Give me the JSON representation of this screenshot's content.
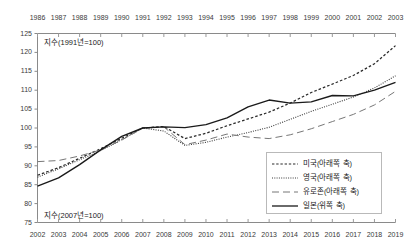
{
  "chart_data": {
    "type": "line",
    "title": "",
    "grid": false,
    "legend_position": "bottom-right",
    "top_axis": {
      "name": "upper-x-axis",
      "label": "지수(1991년=100)",
      "ticks": [
        1986,
        1987,
        1988,
        1989,
        1990,
        1991,
        1992,
        1993,
        1994,
        1995,
        1996,
        1997,
        1998,
        1999,
        2000,
        2001,
        2002,
        2003
      ],
      "range": [
        1986,
        2003
      ]
    },
    "bottom_axis": {
      "name": "lower-x-axis",
      "label": "지수(2007년=100)",
      "ticks": [
        2002,
        2003,
        2004,
        2005,
        2006,
        2007,
        2008,
        2009,
        2010,
        2011,
        2012,
        2013,
        2014,
        2015,
        2016,
        2017,
        2018,
        2019
      ],
      "range": [
        2002,
        2019
      ]
    },
    "yaxis": {
      "ticks": [
        75,
        80,
        85,
        90,
        95,
        100,
        105,
        110,
        115,
        120,
        125
      ],
      "ylim": [
        75,
        125
      ],
      "ylabel": ""
    },
    "series": [
      {
        "name": "미국(아래쪽 축)",
        "legend_label": "미국(아래쪽 축)",
        "axis": "bottom",
        "style": "dashed",
        "color": "#2b2b2b",
        "x": [
          2002,
          2003,
          2004,
          2005,
          2006,
          2007,
          2008,
          2009,
          2010,
          2011,
          2012,
          2013,
          2014,
          2015,
          2016,
          2017,
          2018,
          2019
        ],
        "values": [
          87.5,
          89.5,
          92.0,
          94.5,
          97.3,
          100.0,
          100.4,
          97.2,
          98.6,
          100.6,
          102.4,
          104.2,
          106.6,
          109.4,
          111.6,
          113.9,
          117.0,
          121.8
        ]
      },
      {
        "name": "영국(아래쪽 축)",
        "legend_label": "영국(아래쪽 축)",
        "axis": "bottom",
        "style": "dotted",
        "color": "#3a3a3a",
        "x": [
          2002,
          2003,
          2004,
          2005,
          2006,
          2007,
          2008,
          2009,
          2010,
          2011,
          2012,
          2013,
          2014,
          2015,
          2016,
          2017,
          2018,
          2019
        ],
        "values": [
          87.0,
          89.2,
          91.6,
          94.0,
          96.9,
          100.0,
          99.2,
          95.4,
          96.2,
          97.6,
          98.8,
          100.2,
          102.3,
          104.4,
          106.3,
          108.2,
          110.6,
          113.8
        ]
      },
      {
        "name": "유로존(아래쪽 축)",
        "legend_label": "유로존(아래쪽 축)",
        "axis": "bottom",
        "style": "longdash",
        "color": "#777777",
        "x": [
          2002,
          2003,
          2004,
          2005,
          2006,
          2007,
          2008,
          2009,
          2010,
          2011,
          2012,
          2013,
          2014,
          2015,
          2016,
          2017,
          2018,
          2019
        ],
        "values": [
          91.1,
          91.4,
          92.6,
          94.2,
          96.8,
          100.0,
          100.3,
          95.6,
          96.8,
          98.4,
          97.6,
          97.2,
          98.2,
          99.8,
          101.7,
          103.6,
          106.1,
          109.7
        ]
      },
      {
        "name": "일본(위쪽 축)",
        "legend_label": "일본(위쪽 축)",
        "axis": "top",
        "style": "solid",
        "color": "#1a1a1a",
        "x": [
          1986,
          1987,
          1988,
          1989,
          1990,
          1991,
          1992,
          1993,
          1994,
          1995,
          1996,
          1997,
          1998,
          1999,
          2000,
          2001,
          2002,
          2003
        ],
        "values": [
          84.6,
          86.8,
          90.3,
          94.2,
          97.8,
          100.0,
          100.3,
          100.1,
          100.9,
          102.7,
          105.6,
          107.4,
          106.6,
          106.9,
          108.6,
          108.5,
          110.0,
          112.1
        ]
      }
    ]
  },
  "legend": {
    "items": [
      {
        "label": "미국(아래쪽 축)",
        "style": "dashed"
      },
      {
        "label": "영국(아래쪽 축)",
        "style": "dotted"
      },
      {
        "label": "유로존(아래쪽 축)",
        "style": "longdash"
      },
      {
        "label": "일본(위쪽 축)",
        "style": "solid"
      }
    ]
  }
}
